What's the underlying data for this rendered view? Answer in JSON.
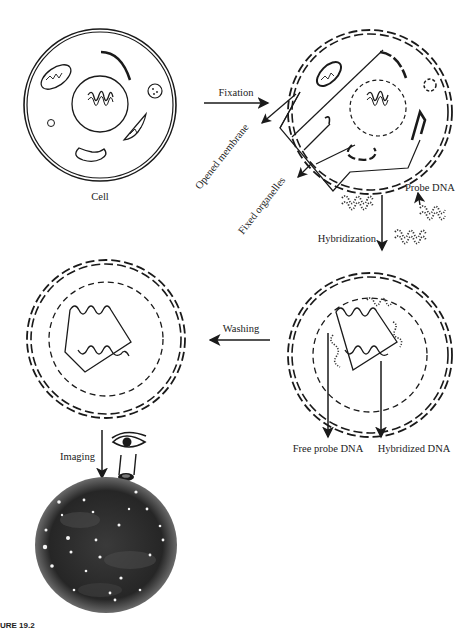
{
  "diagram": {
    "type": "process-flow",
    "stages": [
      {
        "id": "cell",
        "label": "Cell"
      },
      {
        "id": "fixed-cell",
        "label": ""
      },
      {
        "id": "hybridized-cell",
        "label": ""
      },
      {
        "id": "washed-cell",
        "label": ""
      },
      {
        "id": "image",
        "label": ""
      }
    ],
    "steps": {
      "fixation": "Fixation",
      "hybridization": "Hybridization",
      "washing": "Washing",
      "imaging": "Imaging"
    },
    "annotations": {
      "opened_membrane": "Opened membrane",
      "fixed_organelles": "Fixed organelles",
      "probe_dna": "Probe DNA",
      "free_probe_dna": "Free probe DNA",
      "hybridized_dna": "Hybridized DNA"
    },
    "caption": "URE 19.2",
    "colors": {
      "line": "#1a1a1a",
      "background": "#ffffff",
      "micrograph_bg": "#2b2b2b",
      "spot": "#f5f5f5"
    }
  }
}
